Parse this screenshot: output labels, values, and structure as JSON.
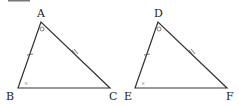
{
  "figure": {
    "caption_partial": "[図4]",
    "triangle_1": {
      "vertices": {
        "A": "A",
        "B": "B",
        "C": "C"
      },
      "marks": {
        "angle_A": "circle",
        "angle_B": "dot",
        "side_AB": "single-tick",
        "side_AC": "double-tick"
      }
    },
    "triangle_2": {
      "vertices": {
        "D": "D",
        "E": "E",
        "F": "F"
      },
      "marks": {
        "angle_D": "circle",
        "angle_E": "dot",
        "side_DE": "single-tick",
        "side_DF": "double-tick"
      }
    },
    "stroke_color": "#333333"
  }
}
